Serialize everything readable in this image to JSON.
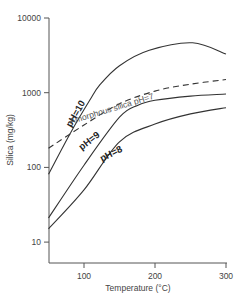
{
  "chart_data": {
    "type": "line",
    "title": "",
    "xlabel": "Temperature (°C)",
    "ylabel": "Silica (mg/kg)",
    "x_scale": "linear",
    "y_scale": "log",
    "xlim": [
      50,
      300
    ],
    "ylim": [
      5.3,
      10000
    ],
    "x_ticks": [
      100,
      200,
      300
    ],
    "x_tick_labels": [
      "100",
      "200",
      "300"
    ],
    "y_ticks": [
      10,
      100,
      1000,
      10000
    ],
    "y_tick_labels": [
      "10",
      "100",
      "1000",
      "10000"
    ],
    "grid": false,
    "legend": null,
    "series": [
      {
        "name": "pH=10",
        "style": "solid",
        "label": "pH=10",
        "points": [
          [
            50,
            81
          ],
          [
            81,
            290
          ],
          [
            108,
            790
          ],
          [
            122,
            1260
          ],
          [
            150,
            2300
          ],
          [
            192,
            3700
          ],
          [
            253,
            4650
          ],
          [
            300,
            3300
          ]
        ]
      },
      {
        "name": "Amorphous silica pH=7",
        "style": "dashed",
        "label": "Amorphous silica pH=7",
        "points": [
          [
            50,
            180
          ],
          [
            100,
            370
          ],
          [
            150,
            710
          ],
          [
            200,
            1050
          ],
          [
            250,
            1300
          ],
          [
            300,
            1500
          ]
        ]
      },
      {
        "name": "pH=9",
        "style": "solid",
        "label": "pH=9",
        "points": [
          [
            50,
            21
          ],
          [
            100,
            107
          ],
          [
            150,
            470
          ],
          [
            176,
            680
          ],
          [
            200,
            790
          ],
          [
            250,
            900
          ],
          [
            300,
            960
          ]
        ]
      },
      {
        "name": "pH=8",
        "style": "solid",
        "label": "pH=8",
        "points": [
          [
            50,
            15
          ],
          [
            100,
            50
          ],
          [
            150,
            220
          ],
          [
            200,
            380
          ],
          [
            250,
            520
          ],
          [
            300,
            630
          ]
        ]
      }
    ],
    "annotations": [
      {
        "text": "pH=10",
        "x": 92,
        "y": 500,
        "rotation": -60
      },
      {
        "text": "Amorphous silica pH=7",
        "x": 140,
        "y": 560,
        "rotation": -17
      },
      {
        "text": "pH=9",
        "x": 110,
        "y": 210,
        "rotation": -38
      },
      {
        "text": "pH=8",
        "x": 140,
        "y": 140,
        "rotation": -27
      }
    ]
  }
}
